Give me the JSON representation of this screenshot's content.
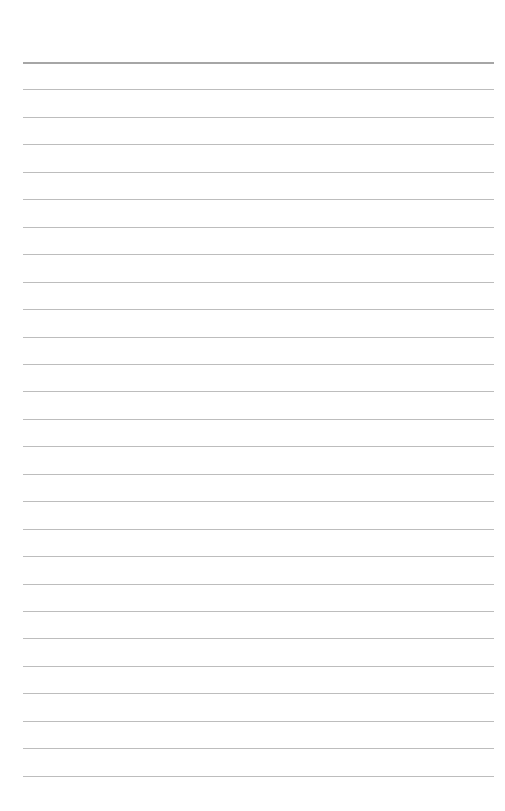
{
  "page": {
    "type": "blank lined paper",
    "background_color": "#ffffff",
    "rule_color": "#bdbdbd",
    "top_rule_color": "#a6a6a6",
    "rule_count": 27,
    "first_rule_y": 62,
    "rule_spacing": 27.45,
    "rule_left": 23,
    "rule_right": 494
  }
}
